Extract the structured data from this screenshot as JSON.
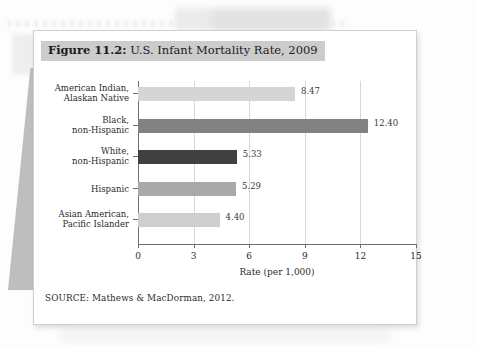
{
  "figure": {
    "number_label": "Figure 11.2:",
    "title_text": " U.S. Infant Mortality Rate, 2009",
    "source": "SOURCE: Mathews & MacDorman, 2012."
  },
  "chart_data": {
    "type": "bar",
    "orientation": "horizontal",
    "title": "Figure 11.2: U.S. Infant Mortality Rate, 2009",
    "xlabel": "Rate (per 1,000)",
    "ylabel": "",
    "xlim": [
      0,
      15
    ],
    "xticks": [
      0,
      3,
      6,
      9,
      12,
      15
    ],
    "xtick_labels": [
      "0",
      "3",
      "6",
      "9",
      "12",
      "15"
    ],
    "grid": true,
    "legend": false,
    "categories": [
      "American Indian,\nAlaskan Native",
      "Black,\nnon-Hispanic",
      "White,\nnon-Hispanic",
      "Hispanic",
      "Asian American,\nPacific Islander"
    ],
    "values": [
      8.47,
      12.4,
      5.33,
      5.29,
      4.4
    ],
    "value_labels": [
      "8.47",
      "12.40",
      "5.33",
      "5.29",
      "4.40"
    ],
    "bar_colors": [
      "#d5d5d5",
      "#828282",
      "#414141",
      "#a9a9a9",
      "#cecece"
    ]
  },
  "bars": [
    {
      "line1": "American Indian,",
      "line2": "Alaskan Native",
      "value": 8.47,
      "value_label": "8.47",
      "color": "#d5d5d5"
    },
    {
      "line1": "Black,",
      "line2": "non-Hispanic",
      "value": 12.4,
      "value_label": "12.40",
      "color": "#828282"
    },
    {
      "line1": "White,",
      "line2": "non-Hispanic",
      "value": 5.33,
      "value_label": "5.33",
      "color": "#414141"
    },
    {
      "line1": "Hispanic",
      "line2": "",
      "value": 5.29,
      "value_label": "5.29",
      "color": "#a9a9a9"
    },
    {
      "line1": "Asian American,",
      "line2": "Pacific Islander",
      "value": 4.4,
      "value_label": "4.40",
      "color": "#cecece"
    }
  ],
  "axis": {
    "x_title": "Rate (per 1,000)",
    "x_ticks": [
      "0",
      "3",
      "6",
      "9",
      "12",
      "15"
    ]
  }
}
